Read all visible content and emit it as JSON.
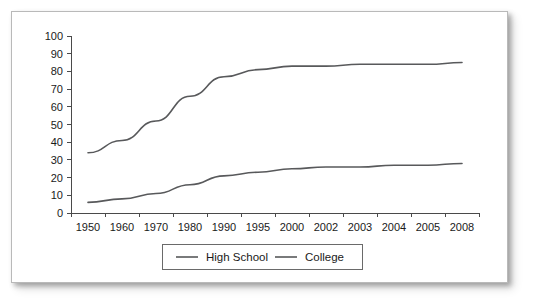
{
  "chart_data": {
    "type": "line",
    "title": "",
    "subtitle": "",
    "xlabel": "",
    "ylabel": "",
    "categories": [
      "1950",
      "1960",
      "1970",
      "1980",
      "1990",
      "1995",
      "2000",
      "2002",
      "2003",
      "2004",
      "2005",
      "2008"
    ],
    "series": [
      {
        "name": "High School",
        "color": "#58595b",
        "values": [
          34,
          41,
          52,
          66,
          77,
          81,
          83,
          83,
          84,
          84,
          84,
          85
        ]
      },
      {
        "name": "College",
        "color": "#58595b",
        "values": [
          6,
          8,
          11,
          16,
          21,
          23,
          25,
          26,
          26,
          27,
          27,
          28
        ]
      }
    ],
    "ylim": [
      0,
      100
    ],
    "y_ticks": [
      "0",
      "10",
      "20",
      "30",
      "40",
      "50",
      "60",
      "70",
      "80",
      "90",
      "100"
    ],
    "grid": false,
    "legend_position": "bottom",
    "legend_entries": [
      "High School",
      "College"
    ]
  },
  "legend": {
    "entry_high_school": "High School",
    "entry_college": "College"
  },
  "colors": {
    "line": "#58595b",
    "axis": "#4a4a4a",
    "text": "#1a1a1a",
    "card_border": "#b9b9b9",
    "background": "#ffffff"
  }
}
